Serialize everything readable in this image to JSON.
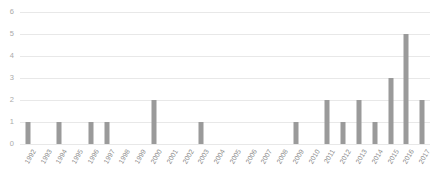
{
  "chart_data": {
    "type": "bar",
    "title": "",
    "subtitle": "",
    "xlabel": "",
    "ylabel": "",
    "categories": [
      "1992",
      "1993",
      "1994",
      "1995",
      "1996",
      "1997",
      "1998",
      "1999",
      "2000",
      "2001",
      "2002",
      "2003",
      "2004",
      "2005",
      "2006",
      "2007",
      "2008",
      "2009",
      "2010",
      "2011",
      "2012",
      "2013",
      "2014",
      "2015",
      "2016",
      "2017"
    ],
    "values": [
      1,
      0,
      1,
      0,
      1,
      1,
      0,
      0,
      2,
      0,
      0,
      1,
      0,
      0,
      0,
      0,
      0,
      1,
      0,
      2,
      1,
      2,
      1,
      3,
      5,
      2
    ],
    "ylim": [
      0,
      6
    ],
    "yticks": [
      "0",
      "1",
      "2",
      "3",
      "4",
      "5",
      "6"
    ],
    "grid": true,
    "legend": false,
    "legend_position": "none",
    "bar_color": "#9a9a9a",
    "gridline_color": "#e8e8e8",
    "tick_label_color": "#8c8c8c",
    "background_color": "#ffffff"
  }
}
